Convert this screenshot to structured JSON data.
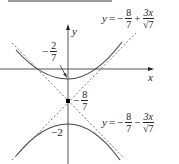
{
  "diagram": {
    "type": "hyperbola-with-asymptotes",
    "axes": {
      "x_label": "x",
      "y_label": "y"
    },
    "asymptotes": [
      {
        "lhs": "y",
        "eq": "=",
        "sign": "−",
        "frac_num": "8",
        "frac_den": "7",
        "op": "+",
        "term_num": "3x",
        "term_den": "√7"
      },
      {
        "lhs": "y",
        "eq": "=",
        "sign": "−",
        "frac_num": "8",
        "frac_den": "7",
        "op": "−",
        "term_num": "3x",
        "term_den": "√7"
      }
    ],
    "annotations": {
      "upper_vertex": {
        "sign": "−",
        "num": "2",
        "den": "7"
      },
      "center": {
        "sign": "−",
        "num": "8",
        "den": "7"
      },
      "lower_vertex": "−2"
    },
    "colors": {
      "curve": "#444444",
      "axis": "#555555",
      "asymptote": "#777777",
      "center_point": "#000000",
      "top_bar": "#9a9a9a"
    }
  }
}
